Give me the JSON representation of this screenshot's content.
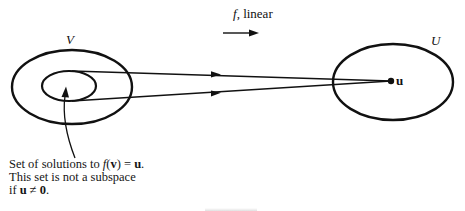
{
  "diagram": {
    "title_arrow_label": {
      "func": "f",
      "rest": ", linear"
    },
    "domain_set": {
      "label": "V",
      "outer_ellipse": {
        "cx": 72,
        "cy": 87,
        "rx": 60,
        "ry": 37
      },
      "inner_ellipse": {
        "cx": 69,
        "cy": 86,
        "rx": 27,
        "ry": 15
      }
    },
    "codomain_set": {
      "label": "U",
      "ellipse": {
        "cx": 393,
        "cy": 82,
        "rx": 60,
        "ry": 38
      },
      "point_label": "u",
      "point": {
        "x": 391,
        "y": 81
      }
    },
    "mapping_arrows": [
      {
        "from": [
          72,
          71
        ],
        "to": [
          391,
          81
        ],
        "arrowhead_at": [
          218,
          75
        ]
      },
      {
        "from": [
          72,
          101
        ],
        "to": [
          391,
          81
        ],
        "arrowhead_at": [
          218,
          93
        ]
      }
    ],
    "caption": {
      "line1_prefix": "Set of solutions to ",
      "line1_func": "f",
      "line1_open": "(",
      "line1_var": "v",
      "line1_close": ") = ",
      "line1_u": "u",
      "line1_end": ".",
      "line2": "This set is not a subspace",
      "line3_prefix": "if ",
      "line3_u": "u",
      "line3_neq": " ≠ ",
      "line3_zero": "0",
      "line3_end": "."
    },
    "colors": {
      "stroke": "#111111",
      "background": "#ffffff"
    }
  }
}
